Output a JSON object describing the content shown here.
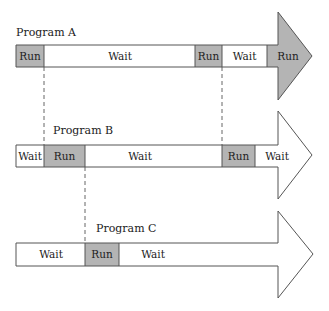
{
  "diagram": {
    "type": "multiprogramming-timeline",
    "colors": {
      "run": "#b4b4b4",
      "wait": "#ffffff",
      "stroke": "#555555",
      "dash": "#555555"
    },
    "programs": [
      {
        "name": "Program A",
        "segments": [
          {
            "label": "Run",
            "state": "run"
          },
          {
            "label": "Wait",
            "state": "wait"
          },
          {
            "label": "Run",
            "state": "run"
          },
          {
            "label": "Wait",
            "state": "wait"
          },
          {
            "label": "Run",
            "state": "run"
          }
        ]
      },
      {
        "name": "Program B",
        "segments": [
          {
            "label": "Wait",
            "state": "wait"
          },
          {
            "label": "Run",
            "state": "run"
          },
          {
            "label": "Wait",
            "state": "wait"
          },
          {
            "label": "Run",
            "state": "run"
          },
          {
            "label": "Wait",
            "state": "wait"
          }
        ]
      },
      {
        "name": "Program C",
        "segments": [
          {
            "label": "Wait",
            "state": "wait"
          },
          {
            "label": "Run",
            "state": "run"
          },
          {
            "label": "Wait",
            "state": "wait"
          }
        ]
      }
    ]
  }
}
